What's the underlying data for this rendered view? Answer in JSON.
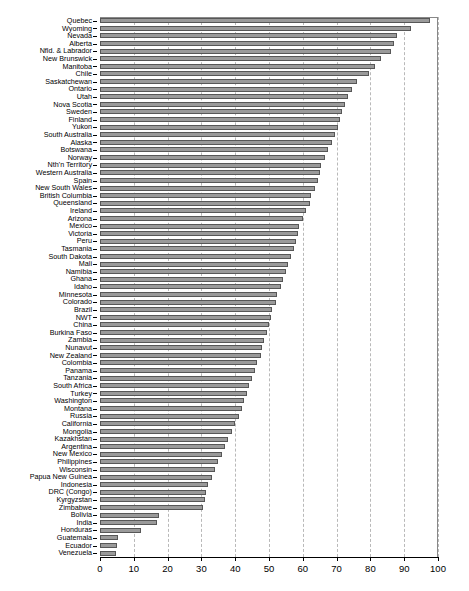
{
  "chart_data": {
    "type": "bar",
    "orientation": "horizontal",
    "title": "",
    "xlabel": "",
    "ylabel": "",
    "xlim": [
      0,
      100
    ],
    "xticks": [
      0,
      10,
      20,
      30,
      40,
      50,
      60,
      70,
      80,
      90,
      100
    ],
    "grid": true,
    "grid_axis": "x",
    "grid_style": "dashed",
    "legend": "none",
    "bar_color": "#9a9a9a",
    "bar_edge_color": "#575757",
    "background_color": "#ffffff",
    "frame_color": "#888888",
    "categories": [
      "Quebec",
      "Wyoming",
      "Nevada",
      "Alberta",
      "Nfld. & Labrador",
      "New Brunswick",
      "Manitoba",
      "Chile",
      "Saskatchewan",
      "Ontario",
      "Utah",
      "Nova Scotia",
      "Sweden",
      "Finland",
      "Yukon",
      "South Australia",
      "Alaska",
      "Botswana",
      "Norway",
      "Nth'n Territory",
      "Western Australia",
      "Spain",
      "New South Wales",
      "British Columbia",
      "Queensland",
      "Ireland",
      "Arizona",
      "Mexico",
      "Victoria",
      "Peru",
      "Tasmania",
      "South Dakota",
      "Mali",
      "Namibia",
      "Ghana",
      "Idaho",
      "Minnesota",
      "Colorado",
      "Brazil",
      "NWT",
      "China",
      "Burkina Faso",
      "Zambia",
      "Nunavut",
      "New Zealand",
      "Colombia",
      "Panama",
      "Tanzania",
      "South Africa",
      "Turkey",
      "Washington",
      "Montana",
      "Russia",
      "California",
      "Mongolia",
      "Kazakhstan",
      "Argentina",
      "New Mexico",
      "Philippines",
      "Wisconsin",
      "Papua New Guinea",
      "Indonesia",
      "DRC (Congo)",
      "Kyrgyzstan",
      "Zimbabwe",
      "Bolivia",
      "India",
      "Honduras",
      "Guatemala",
      "Ecuador",
      "Venezuela"
    ],
    "values": [
      97.5,
      92.0,
      88.0,
      87.0,
      86.0,
      83.0,
      81.5,
      79.5,
      76.0,
      74.5,
      73.5,
      72.5,
      71.5,
      71.0,
      70.5,
      69.5,
      68.5,
      67.5,
      66.5,
      65.5,
      65.0,
      64.5,
      63.5,
      62.5,
      62.0,
      61.0,
      60.0,
      59.0,
      58.5,
      58.0,
      57.5,
      56.5,
      55.5,
      55.0,
      54.0,
      53.5,
      52.5,
      52.0,
      51.0,
      50.5,
      50.0,
      49.5,
      48.5,
      48.0,
      47.5,
      46.5,
      46.0,
      45.0,
      44.0,
      43.5,
      42.5,
      42.0,
      41.0,
      40.0,
      39.0,
      38.0,
      37.0,
      36.0,
      35.0,
      34.0,
      33.0,
      32.0,
      31.5,
      31.0,
      30.5,
      17.5,
      17.0,
      12.0,
      5.3,
      5.0,
      4.7
    ]
  }
}
